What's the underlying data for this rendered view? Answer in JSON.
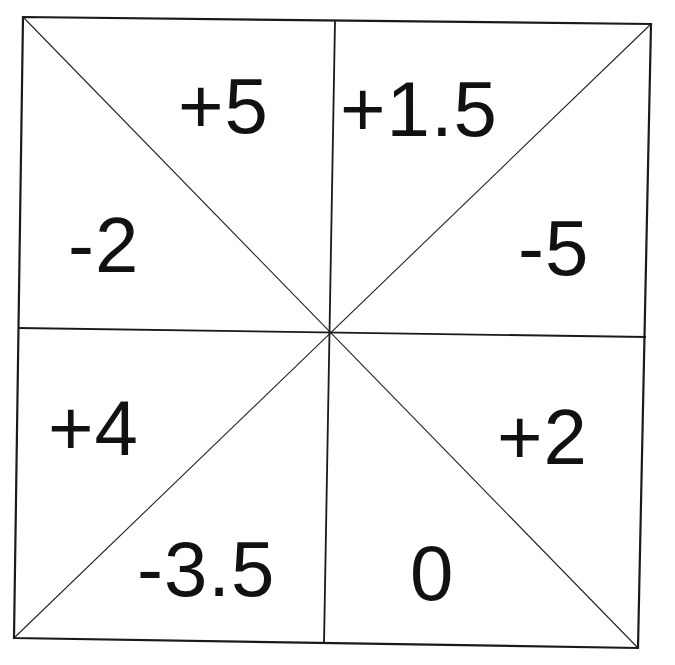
{
  "diagram": {
    "corners": {
      "top_left": [
        23,
        17
      ],
      "top_right": [
        651,
        24
      ],
      "bottom_right": [
        638,
        648
      ],
      "bottom_left": [
        14,
        638
      ]
    },
    "center": [
      330,
      332
    ],
    "midlines": {
      "vertical": {
        "top": [
          335,
          21
        ],
        "bottom": [
          324,
          644
        ]
      },
      "horizontal": {
        "left": [
          18,
          328
        ],
        "right": [
          646,
          337
        ]
      }
    },
    "colors": {
      "line": "#1a1a1a",
      "text": "#111111",
      "background": "#ffffff"
    },
    "regions": [
      {
        "id": "top-left-upper",
        "quadrant": "top-left",
        "position": "upper",
        "value": "+5",
        "x": 178,
        "y": 133
      },
      {
        "id": "top-right-upper",
        "quadrant": "top-right",
        "position": "upper",
        "value": "+1.5",
        "x": 340,
        "y": 136
      },
      {
        "id": "top-left-lower",
        "quadrant": "top-left",
        "position": "lower",
        "value": "-2",
        "x": 68,
        "y": 272
      },
      {
        "id": "top-right-lower",
        "quadrant": "top-right",
        "position": "lower",
        "value": "-5",
        "x": 518,
        "y": 275
      },
      {
        "id": "bottom-left-upper",
        "quadrant": "bottom-left",
        "position": "upper",
        "value": "+4",
        "x": 48,
        "y": 455
      },
      {
        "id": "bottom-right-upper",
        "quadrant": "bottom-right",
        "position": "upper",
        "value": "+2",
        "x": 497,
        "y": 464
      },
      {
        "id": "bottom-left-lower",
        "quadrant": "bottom-left",
        "position": "lower",
        "value": "-3.5",
        "x": 137,
        "y": 596
      },
      {
        "id": "bottom-right-lower",
        "quadrant": "bottom-right",
        "position": "lower",
        "value": "0",
        "x": 410,
        "y": 600
      }
    ]
  }
}
